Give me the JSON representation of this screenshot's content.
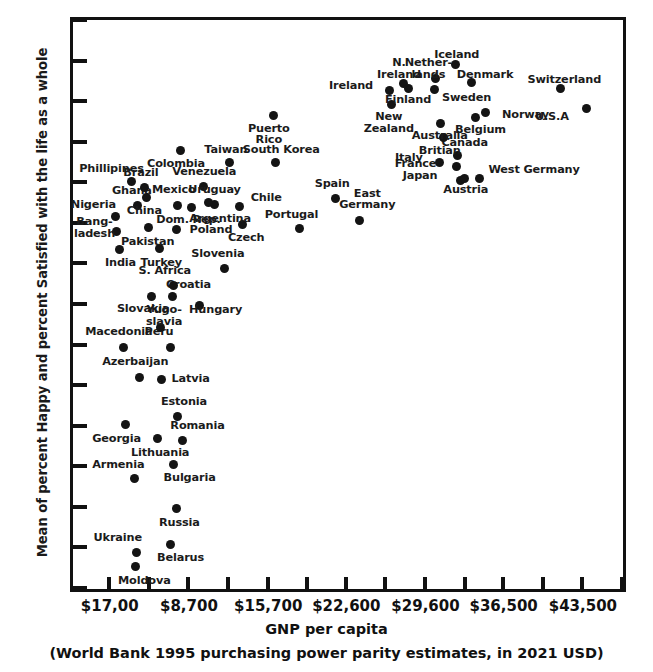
{
  "chart_data": {
    "type": "scatter",
    "title": "",
    "xlabel": "GNP per capita",
    "xsublabel": "(World Bank 1995 purchasing power parity estimates, in 2021 USD)",
    "ylabel": "Mean of percent Happy and percent Satisfied with the life as a whole",
    "ylim": [
      30,
      100
    ],
    "yticks": [
      30,
      35,
      40,
      45,
      50,
      55,
      60,
      65,
      70,
      75,
      80,
      85,
      90,
      95,
      100
    ],
    "ytick_labels": [
      "30",
      "35",
      "40",
      "45",
      "50",
      "55",
      "60",
      "65",
      "70",
      "75",
      "80",
      "85",
      "90",
      "95",
      "100"
    ],
    "xtick_labels": [
      "$17,00",
      "$8,700",
      "$15,700",
      "$22,600",
      "$29,600",
      "$36,500",
      "$43,500"
    ],
    "xtick_values": [
      1700,
      8700,
      15700,
      22600,
      29600,
      36500,
      43500
    ],
    "xlim": [
      -1500,
      47000
    ],
    "grid": false,
    "legend": null,
    "marker_color": "#141414",
    "axis_color": "#111111",
    "points": [
      {
        "name": "Moldova",
        "x": 4050,
        "y": 32.7,
        "label": "Moldova",
        "lx": 4800,
        "ly": 30.9,
        "align": "c"
      },
      {
        "name": "Ukraine",
        "x": 4100,
        "y": 34.4,
        "label": "Ukraine",
        "lx": 2450,
        "ly": 36.2,
        "align": "c"
      },
      {
        "name": "Belarus",
        "x": 7100,
        "y": 35.4,
        "label": "Belarus",
        "lx": 8000,
        "ly": 33.7,
        "align": "c"
      },
      {
        "name": "Russia",
        "x": 7600,
        "y": 39.8,
        "label": "Russia",
        "lx": 7900,
        "ly": 38.0,
        "align": "c"
      },
      {
        "name": "Armenia",
        "x": 3900,
        "y": 43.5,
        "label": "Armenia",
        "lx": 2500,
        "ly": 45.1,
        "align": "c"
      },
      {
        "name": "Bulgaria",
        "x": 7400,
        "y": 45.2,
        "label": "Bulgaria",
        "lx": 8800,
        "ly": 43.6,
        "align": "c"
      },
      {
        "name": "Georgia",
        "x": 3100,
        "y": 50.2,
        "label": "Georgia",
        "lx": 2350,
        "ly": 48.4,
        "align": "c"
      },
      {
        "name": "Lithuania",
        "x": 6000,
        "y": 48.4,
        "label": "Lithuania",
        "lx": 6200,
        "ly": 46.6,
        "align": "c"
      },
      {
        "name": "Romania",
        "x": 8200,
        "y": 48.2,
        "label": "Romania",
        "lx": 9500,
        "ly": 50.0,
        "align": "c"
      },
      {
        "name": "Estonia",
        "x": 7700,
        "y": 51.1,
        "label": "Estonia",
        "lx": 8300,
        "ly": 52.9,
        "align": "c"
      },
      {
        "name": "Azerbaijan",
        "x": 4400,
        "y": 56.0,
        "label": "Azerbaijan",
        "lx": 4000,
        "ly": 57.8,
        "align": "c"
      },
      {
        "name": "Latvia",
        "x": 6300,
        "y": 55.7,
        "label": "Latvia",
        "lx": 7200,
        "ly": 55.7,
        "align": "l"
      },
      {
        "name": "Macedonia",
        "x": 3000,
        "y": 59.7,
        "label": "Macedonia",
        "lx": 2550,
        "ly": 61.5,
        "align": "c"
      },
      {
        "name": "Peru",
        "x": 7100,
        "y": 59.7,
        "label": "Peru",
        "lx": 6100,
        "ly": 61.5,
        "align": "c"
      },
      {
        "name": "Yugo-slavia",
        "x": 6200,
        "y": 62.1,
        "label": "Yugo-\nslavia",
        "lx": 6550,
        "ly": 64.2,
        "align": "c"
      },
      {
        "name": "Slovakia",
        "x": 5400,
        "y": 65.9,
        "label": "Slovakia",
        "lx": 4700,
        "ly": 64.4,
        "align": "c"
      },
      {
        "name": "Croatia",
        "x": 7300,
        "y": 65.9,
        "label": "Croatia",
        "lx": 8700,
        "ly": 67.3,
        "align": "c"
      },
      {
        "name": "Hungary",
        "x": 9700,
        "y": 64.8,
        "label": "Hungary",
        "lx": 11100,
        "ly": 64.3,
        "align": "c"
      },
      {
        "name": "S. Africa",
        "x": 7400,
        "y": 67.3,
        "label": "S. Africa",
        "lx": 6600,
        "ly": 69.1,
        "align": "c"
      },
      {
        "name": "Slovenia",
        "x": 11900,
        "y": 69.4,
        "label": "Slovenia",
        "lx": 11300,
        "ly": 71.2,
        "align": "c"
      },
      {
        "name": "Turkey",
        "x": 6100,
        "y": 71.8,
        "label": "Turkey",
        "lx": 6300,
        "ly": 70.1,
        "align": "c"
      },
      {
        "name": "India",
        "x": 2600,
        "y": 71.7,
        "label": "India",
        "lx": 2700,
        "ly": 70.0,
        "align": "c"
      },
      {
        "name": "Bangladesh",
        "x": 2300,
        "y": 73.9,
        "label": "Bang-\nladesh",
        "lx": 400,
        "ly": 75.1,
        "align": "c"
      },
      {
        "name": "Pakistan",
        "x": 5200,
        "y": 74.4,
        "label": "Pakistan",
        "lx": 5100,
        "ly": 72.7,
        "align": "c"
      },
      {
        "name": "Poland",
        "x": 7600,
        "y": 74.2,
        "label": "Poland",
        "lx": 8800,
        "ly": 74.1,
        "align": "l"
      },
      {
        "name": "Czech",
        "x": 13500,
        "y": 74.8,
        "label": "Czech",
        "lx": 13800,
        "ly": 73.1,
        "align": "c"
      },
      {
        "name": "Portugal",
        "x": 18500,
        "y": 74.3,
        "label": "Portugal",
        "lx": 17800,
        "ly": 76.0,
        "align": "c"
      },
      {
        "name": "East Germany",
        "x": 23800,
        "y": 75.3,
        "label": "East\nGermany",
        "lx": 24500,
        "ly": 78.6,
        "align": "c"
      },
      {
        "name": "Nigeria",
        "x": 2250,
        "y": 75.8,
        "label": "Nigeria",
        "lx": 300,
        "ly": 77.2,
        "align": "c"
      },
      {
        "name": "Ghana",
        "x": 4200,
        "y": 77.2,
        "label": "Ghana",
        "lx": 3700,
        "ly": 78.9,
        "align": "c"
      },
      {
        "name": "Mexico",
        "x": 7700,
        "y": 77.2,
        "label": "Mexico",
        "lx": 7400,
        "ly": 79.0,
        "align": "c"
      },
      {
        "name": "Dom. Rep.",
        "x": 9000,
        "y": 76.9,
        "label": "Dom. Rep.",
        "lx": 8700,
        "ly": 75.4,
        "align": "c"
      },
      {
        "name": "Argentina",
        "x": 11000,
        "y": 77.3,
        "label": "Argentina",
        "lx": 11500,
        "ly": 75.5,
        "align": "c"
      },
      {
        "name": "Chile",
        "x": 13200,
        "y": 77.0,
        "label": "Chile",
        "lx": 14200,
        "ly": 78.1,
        "align": "l"
      },
      {
        "name": "China",
        "x": 5000,
        "y": 78.1,
        "label": "China",
        "lx": 4800,
        "ly": 76.4,
        "align": "c"
      },
      {
        "name": "Brazil",
        "x": 4800,
        "y": 79.4,
        "label": "Brazil",
        "lx": 4500,
        "ly": 81.1,
        "align": "c"
      },
      {
        "name": "Venezuela",
        "x": 10000,
        "y": 79.5,
        "label": "Venezuela",
        "lx": 10100,
        "ly": 81.3,
        "align": "c"
      },
      {
        "name": "Uruguay",
        "x": 10500,
        "y": 77.5,
        "label": "Uruguay",
        "lx": 11000,
        "ly": 79.1,
        "align": "c"
      },
      {
        "name": "Phillipines",
        "x": 3700,
        "y": 80.1,
        "label": "Phillipines",
        "lx": 1900,
        "ly": 81.6,
        "align": "c"
      },
      {
        "name": "Spain",
        "x": 21700,
        "y": 78.0,
        "label": "Spain",
        "lx": 21400,
        "ly": 79.8,
        "align": "c"
      },
      {
        "name": "Colombia",
        "x": 8000,
        "y": 83.9,
        "label": "Colombia",
        "lx": 7600,
        "ly": 82.3,
        "align": "c"
      },
      {
        "name": "Taiwan",
        "x": 12300,
        "y": 82.4,
        "label": "Taiwan",
        "lx": 12000,
        "ly": 84.0,
        "align": "c"
      },
      {
        "name": "South Korea",
        "x": 16400,
        "y": 82.4,
        "label": "South Korea",
        "lx": 16900,
        "ly": 84.0,
        "align": "c"
      },
      {
        "name": "Puerto Rico",
        "x": 16200,
        "y": 88.2,
        "label": "Puerto\nRico",
        "lx": 15800,
        "ly": 86.6,
        "align": "c"
      },
      {
        "name": "Italy",
        "x": 30900,
        "y": 82.4,
        "label": "Italy",
        "lx": 29400,
        "ly": 83.0,
        "align": "r"
      },
      {
        "name": "Japan",
        "x": 32700,
        "y": 80.2,
        "label": "Japan",
        "lx": 30700,
        "ly": 80.8,
        "align": "r"
      },
      {
        "name": "Austria",
        "x": 33100,
        "y": 80.5,
        "label": "Austria",
        "lx": 33200,
        "ly": 79.1,
        "align": "c"
      },
      {
        "name": "France",
        "x": 32400,
        "y": 81.9,
        "label": "France",
        "lx": 30600,
        "ly": 82.2,
        "align": "r"
      },
      {
        "name": "West Germany",
        "x": 34400,
        "y": 80.5,
        "label": "West Germany",
        "lx": 35200,
        "ly": 81.5,
        "align": "l"
      },
      {
        "name": "Canada",
        "x": 32500,
        "y": 83.3,
        "label": "Canada",
        "lx": 33100,
        "ly": 84.9,
        "align": "c"
      },
      {
        "name": "Britian",
        "x": 31200,
        "y": 85.5,
        "label": "Britian",
        "lx": 30900,
        "ly": 83.9,
        "align": "c"
      },
      {
        "name": "Australia",
        "x": 31000,
        "y": 87.3,
        "label": "Australia",
        "lx": 30900,
        "ly": 85.7,
        "align": "c"
      },
      {
        "name": "Belgium",
        "x": 34100,
        "y": 88.0,
        "label": "Belgium",
        "lx": 34500,
        "ly": 86.4,
        "align": "c"
      },
      {
        "name": "Norway",
        "x": 34900,
        "y": 88.6,
        "label": "Norway",
        "lx": 36400,
        "ly": 88.3,
        "align": "l"
      },
      {
        "name": "U.S.A",
        "x": 43900,
        "y": 89.1,
        "label": "U.S.A",
        "lx": 42300,
        "ly": 88.1,
        "align": "r"
      },
      {
        "name": "Switzerland",
        "x": 41600,
        "y": 91.5,
        "label": "Switzerland",
        "lx": 41900,
        "ly": 92.6,
        "align": "c"
      },
      {
        "name": "New Zealand",
        "x": 26600,
        "y": 89.6,
        "label": "New\nZealand",
        "lx": 26400,
        "ly": 88.0,
        "align": "c"
      },
      {
        "name": "Ireland",
        "x": 26500,
        "y": 91.3,
        "label": "Ireland",
        "lx": 25000,
        "ly": 91.9,
        "align": "r"
      },
      {
        "name": "Finland",
        "x": 28100,
        "y": 91.5,
        "label": "Finland",
        "lx": 28100,
        "ly": 90.2,
        "align": "c"
      },
      {
        "name": "N. Ireland",
        "x": 27700,
        "y": 92.2,
        "label": "N.\nIreland",
        "lx": 27300,
        "ly": 94.7,
        "align": "c"
      },
      {
        "name": "Sweden",
        "x": 30400,
        "y": 91.4,
        "label": "Sweden",
        "lx": 31100,
        "ly": 90.4,
        "align": "l"
      },
      {
        "name": "Netherlands",
        "x": 30500,
        "y": 92.8,
        "label": "Nether-\nlands",
        "lx": 29900,
        "ly": 94.7,
        "align": "c"
      },
      {
        "name": "Denmark",
        "x": 33700,
        "y": 92.3,
        "label": "Denmark",
        "lx": 34900,
        "ly": 93.2,
        "align": "c"
      },
      {
        "name": "Iceland",
        "x": 32300,
        "y": 94.5,
        "label": "Iceland",
        "lx": 32400,
        "ly": 95.7,
        "align": "c"
      }
    ]
  }
}
